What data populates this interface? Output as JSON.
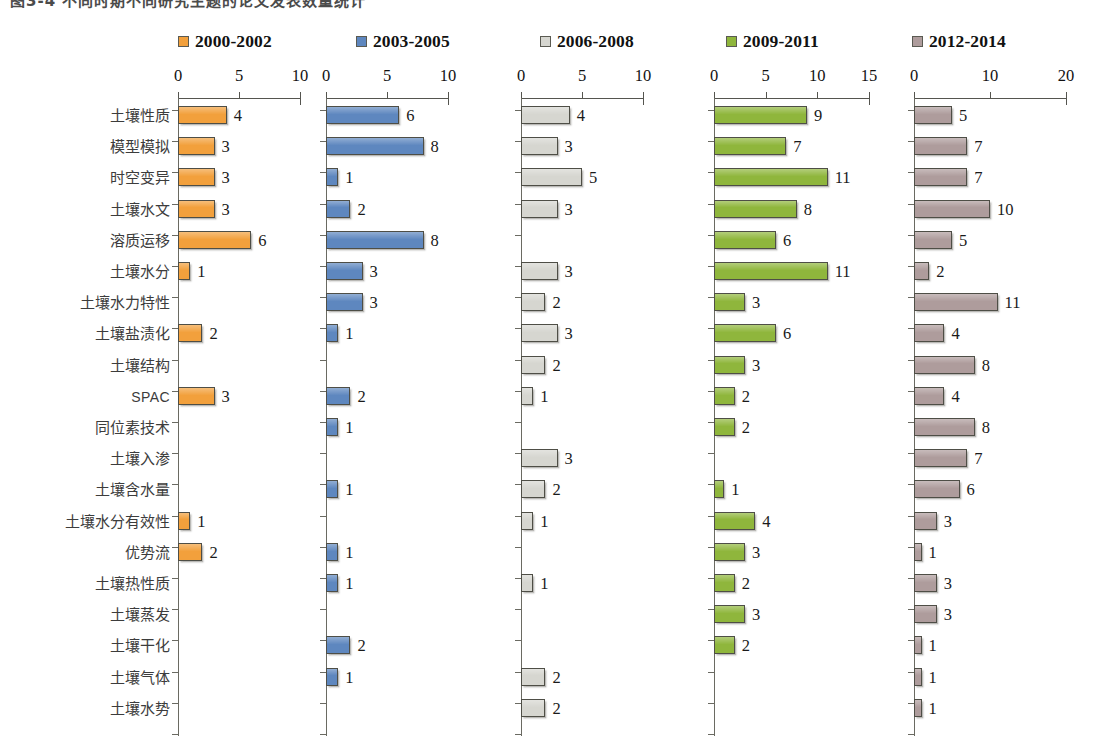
{
  "artifact": {
    "top_smear_text": "图3-4 不同时期不同研究主题的论文发表数量统计"
  },
  "legend": {
    "items": [
      {
        "label": "2000-2002",
        "color": "#F2A03C",
        "x": 178
      },
      {
        "label": "2003-2005",
        "color": "#5E87BF",
        "x": 356
      },
      {
        "label": "2006-2008",
        "color": "#D6D6D0",
        "x": 540
      },
      {
        "label": "2009-2011",
        "color": "#8FB63C",
        "x": 726
      },
      {
        "label": "2012-2014",
        "color": "#AE9C9C",
        "x": 912
      }
    ]
  },
  "chart_data": {
    "type": "bar",
    "orientation": "horizontal",
    "title": "",
    "xlabel": "",
    "ylabel": "",
    "grid": false,
    "legend_position": "top",
    "panel_layout": "five side-by-side horizontal bar panels sharing one category axis",
    "categories": [
      "土壤性质",
      "模型模拟",
      "时空变异",
      "土壤水文",
      "溶质运移",
      "土壤水分",
      "土壤水力特性",
      "土壤盐渍化",
      "土壤结构",
      "SPAC",
      "同位素技术",
      "土壤入渗",
      "土壤含水量",
      "土壤水分有效性",
      "优势流",
      "土壤热性质",
      "土壤蒸发",
      "土壤干化",
      "土壤气体",
      "土壤水势"
    ],
    "panels": [
      {
        "name": "2000-2002",
        "color": "#F2A03C",
        "xlim": [
          0,
          10
        ],
        "xticks": [
          0,
          5,
          10
        ],
        "values": [
          4,
          3,
          3,
          3,
          6,
          1,
          null,
          2,
          null,
          3,
          null,
          null,
          null,
          1,
          2,
          null,
          null,
          null,
          null,
          null
        ]
      },
      {
        "name": "2003-2005",
        "color": "#5E87BF",
        "xlim": [
          0,
          10
        ],
        "xticks": [
          0,
          5,
          10
        ],
        "values": [
          6,
          8,
          1,
          2,
          8,
          3,
          3,
          1,
          null,
          2,
          1,
          null,
          1,
          null,
          1,
          1,
          null,
          2,
          1,
          null
        ]
      },
      {
        "name": "2006-2008",
        "color": "#D6D6D0",
        "xlim": [
          0,
          10
        ],
        "xticks": [
          0,
          5,
          10
        ],
        "values": [
          4,
          3,
          5,
          3,
          null,
          3,
          2,
          3,
          2,
          1,
          null,
          3,
          2,
          1,
          null,
          1,
          null,
          null,
          2,
          2
        ]
      },
      {
        "name": "2009-2011",
        "color": "#8FB63C",
        "xlim": [
          0,
          15
        ],
        "xticks": [
          0,
          5,
          10,
          15
        ],
        "values": [
          9,
          7,
          11,
          8,
          6,
          11,
          3,
          6,
          3,
          2,
          2,
          null,
          1,
          4,
          3,
          2,
          3,
          2,
          null,
          null
        ]
      },
      {
        "name": "2012-2014",
        "color": "#AE9C9C",
        "xlim": [
          0,
          20
        ],
        "xticks": [
          0,
          10,
          20
        ],
        "values": [
          5,
          7,
          7,
          10,
          5,
          2,
          11,
          4,
          8,
          4,
          8,
          7,
          6,
          3,
          1,
          3,
          3,
          1,
          1,
          1
        ]
      }
    ]
  }
}
